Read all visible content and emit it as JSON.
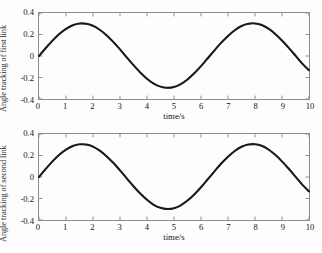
{
  "figure": {
    "background_color": "#fdfdfd",
    "line_color": "#1a1a1a",
    "axis_color": "#8d8d8d"
  },
  "chart_data": [
    {
      "type": "line",
      "title": "",
      "xlabel": "time/s",
      "ylabel": "Angle tracking of first link",
      "xlim": [
        0,
        10
      ],
      "ylim": [
        -0.4,
        0.4
      ],
      "xticks": [
        0,
        1,
        2,
        3,
        4,
        5,
        6,
        7,
        8,
        9,
        10
      ],
      "xtick_labels": [
        "0",
        "1",
        "2",
        "3",
        "4",
        "5",
        "6",
        "7",
        "8",
        "9",
        "10"
      ],
      "yticks": [
        0.4,
        0.2,
        0,
        -0.2,
        -0.4
      ],
      "ytick_labels": [
        "0.4",
        "0.2",
        "0",
        "-0.2",
        "-0.4"
      ],
      "grid": false,
      "legend": null,
      "series": [
        {
          "name": "desired trajectory",
          "x": [
            0,
            0.25,
            0.5,
            0.75,
            1,
            1.25,
            1.5,
            1.75,
            2,
            2.25,
            2.5,
            2.75,
            3,
            3.25,
            3.5,
            3.75,
            4,
            4.25,
            4.5,
            4.75,
            5,
            5.25,
            5.5,
            5.75,
            6,
            6.25,
            6.5,
            6.75,
            7,
            7.25,
            7.5,
            7.75,
            8,
            8.25,
            8.5,
            8.75,
            9,
            9.25,
            9.5,
            9.75,
            10
          ],
          "values": [
            0,
            0.074,
            0.143,
            0.204,
            0.252,
            0.286,
            0.302,
            0.3,
            0.281,
            0.244,
            0.193,
            0.131,
            0.062,
            -0.012,
            -0.085,
            -0.153,
            -0.211,
            -0.257,
            -0.285,
            -0.296,
            -0.288,
            -0.261,
            -0.218,
            -0.161,
            -0.094,
            -0.021,
            0.053,
            0.124,
            0.187,
            0.24,
            0.279,
            0.3,
            0.303,
            0.288,
            0.254,
            0.205,
            0.144,
            0.076,
            0.003,
            -0.071,
            -0.133
          ]
        },
        {
          "name": "actual trajectory",
          "x": [
            0,
            0.25,
            0.5,
            0.75,
            1,
            1.25,
            1.5,
            1.75,
            2,
            2.25,
            2.5,
            2.75,
            3,
            3.25,
            3.5,
            3.75,
            4,
            4.25,
            4.5,
            4.75,
            5,
            5.25,
            5.5,
            5.75,
            6,
            6.25,
            6.5,
            6.75,
            7,
            7.25,
            7.5,
            7.75,
            8,
            8.25,
            8.5,
            8.75,
            9,
            9.25,
            9.5,
            9.75,
            10
          ],
          "values": [
            0,
            0.072,
            0.141,
            0.203,
            0.251,
            0.285,
            0.301,
            0.299,
            0.28,
            0.243,
            0.192,
            0.13,
            0.061,
            -0.013,
            -0.086,
            -0.154,
            -0.212,
            -0.258,
            -0.286,
            -0.297,
            -0.289,
            -0.262,
            -0.219,
            -0.162,
            -0.095,
            -0.022,
            0.052,
            0.123,
            0.186,
            0.239,
            0.278,
            0.299,
            0.302,
            0.287,
            0.253,
            0.204,
            0.143,
            0.075,
            0.002,
            -0.072,
            -0.134
          ]
        }
      ]
    },
    {
      "type": "line",
      "title": "",
      "xlabel": "time/s",
      "ylabel": "Angle tracking of second link",
      "xlim": [
        0,
        10
      ],
      "ylim": [
        -0.4,
        0.4
      ],
      "xticks": [
        0,
        1,
        2,
        3,
        4,
        5,
        6,
        7,
        8,
        9,
        10
      ],
      "xtick_labels": [
        "0",
        "1",
        "2",
        "3",
        "4",
        "5",
        "6",
        "7",
        "8",
        "9",
        "10"
      ],
      "yticks": [
        0.4,
        0.2,
        0,
        -0.2,
        -0.4
      ],
      "ytick_labels": [
        "0.4",
        "0.2",
        "0",
        "-0.2",
        "-0.4"
      ],
      "grid": false,
      "legend": null,
      "series": [
        {
          "name": "desired trajectory",
          "x": [
            0,
            0.25,
            0.5,
            0.75,
            1,
            1.25,
            1.5,
            1.75,
            2,
            2.25,
            2.5,
            2.75,
            3,
            3.25,
            3.5,
            3.75,
            4,
            4.25,
            4.5,
            4.75,
            5,
            5.25,
            5.5,
            5.75,
            6,
            6.25,
            6.5,
            6.75,
            7,
            7.25,
            7.5,
            7.75,
            8,
            8.25,
            8.5,
            8.75,
            9,
            9.25,
            9.5,
            9.75,
            10
          ],
          "values": [
            0,
            0.075,
            0.145,
            0.206,
            0.254,
            0.288,
            0.304,
            0.302,
            0.283,
            0.245,
            0.194,
            0.132,
            0.062,
            -0.012,
            -0.086,
            -0.154,
            -0.212,
            -0.259,
            -0.287,
            -0.298,
            -0.29,
            -0.263,
            -0.219,
            -0.162,
            -0.095,
            -0.021,
            0.053,
            0.125,
            0.188,
            0.242,
            0.281,
            0.302,
            0.305,
            0.29,
            0.256,
            0.206,
            0.145,
            0.077,
            0.003,
            -0.071,
            -0.134
          ]
        },
        {
          "name": "actual trajectory",
          "x": [
            0,
            0.25,
            0.5,
            0.75,
            1,
            1.25,
            1.5,
            1.75,
            2,
            2.25,
            2.5,
            2.75,
            3,
            3.25,
            3.5,
            3.75,
            4,
            4.25,
            4.5,
            4.75,
            5,
            5.25,
            5.5,
            5.75,
            6,
            6.25,
            6.5,
            6.75,
            7,
            7.25,
            7.5,
            7.75,
            8,
            8.25,
            8.5,
            8.75,
            9,
            9.25,
            9.5,
            9.75,
            10
          ],
          "values": [
            0,
            0.073,
            0.143,
            0.205,
            0.253,
            0.287,
            0.303,
            0.301,
            0.282,
            0.244,
            0.193,
            0.131,
            0.061,
            -0.013,
            -0.087,
            -0.155,
            -0.213,
            -0.26,
            -0.288,
            -0.299,
            -0.291,
            -0.264,
            -0.22,
            -0.163,
            -0.096,
            -0.022,
            0.052,
            0.124,
            0.187,
            0.241,
            0.28,
            0.301,
            0.304,
            0.289,
            0.255,
            0.205,
            0.144,
            0.076,
            0.002,
            -0.072,
            -0.135
          ]
        }
      ]
    }
  ]
}
